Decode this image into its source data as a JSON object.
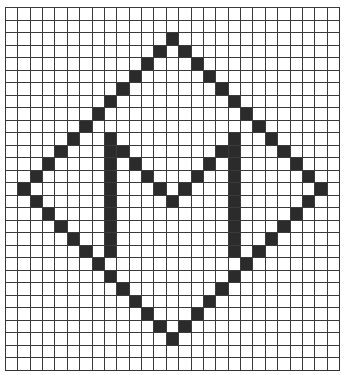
{
  "figure": {
    "grid": {
      "columns": 27,
      "rows": 29
    },
    "colors": {
      "filled": "#2b2b2b",
      "empty": "#ffffff",
      "line": "#3a3a3a"
    },
    "shapes": {
      "diamond": {
        "top": [
          2,
          13
        ],
        "left": [
          14,
          1
        ],
        "right": [
          14,
          25
        ],
        "bottom": [
          26,
          13
        ]
      },
      "letter": "M"
    },
    "filled_cells": [
      [
        2,
        13
      ],
      [
        3,
        12
      ],
      [
        4,
        11
      ],
      [
        5,
        10
      ],
      [
        6,
        9
      ],
      [
        7,
        8
      ],
      [
        8,
        7
      ],
      [
        9,
        6
      ],
      [
        10,
        5
      ],
      [
        11,
        4
      ],
      [
        12,
        3
      ],
      [
        13,
        2
      ],
      [
        14,
        1
      ],
      [
        3,
        14
      ],
      [
        4,
        15
      ],
      [
        5,
        16
      ],
      [
        6,
        17
      ],
      [
        7,
        18
      ],
      [
        8,
        19
      ],
      [
        9,
        20
      ],
      [
        10,
        21
      ],
      [
        11,
        22
      ],
      [
        12,
        23
      ],
      [
        13,
        24
      ],
      [
        14,
        25
      ],
      [
        15,
        2
      ],
      [
        16,
        3
      ],
      [
        17,
        4
      ],
      [
        18,
        5
      ],
      [
        19,
        6
      ],
      [
        20,
        7
      ],
      [
        21,
        8
      ],
      [
        22,
        9
      ],
      [
        23,
        10
      ],
      [
        24,
        11
      ],
      [
        25,
        12
      ],
      [
        26,
        13
      ],
      [
        15,
        24
      ],
      [
        16,
        23
      ],
      [
        17,
        22
      ],
      [
        18,
        21
      ],
      [
        19,
        20
      ],
      [
        20,
        19
      ],
      [
        21,
        18
      ],
      [
        22,
        17
      ],
      [
        23,
        16
      ],
      [
        24,
        15
      ],
      [
        25,
        14
      ],
      [
        10,
        8
      ],
      [
        11,
        8
      ],
      [
        12,
        8
      ],
      [
        13,
        8
      ],
      [
        14,
        8
      ],
      [
        15,
        8
      ],
      [
        16,
        8
      ],
      [
        17,
        8
      ],
      [
        18,
        8
      ],
      [
        19,
        8
      ],
      [
        10,
        18
      ],
      [
        11,
        18
      ],
      [
        12,
        18
      ],
      [
        13,
        18
      ],
      [
        14,
        18
      ],
      [
        15,
        18
      ],
      [
        16,
        18
      ],
      [
        17,
        18
      ],
      [
        18,
        18
      ],
      [
        19,
        18
      ],
      [
        11,
        9
      ],
      [
        12,
        10
      ],
      [
        13,
        11
      ],
      [
        14,
        12
      ],
      [
        15,
        13
      ],
      [
        14,
        14
      ],
      [
        13,
        15
      ],
      [
        12,
        16
      ],
      [
        11,
        17
      ]
    ]
  }
}
